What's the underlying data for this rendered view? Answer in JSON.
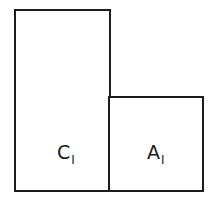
{
  "diagram": {
    "blocks": [
      {
        "id": "c1",
        "label_main": "C",
        "label_sub": "I"
      },
      {
        "id": "a1",
        "label_main": "A",
        "label_sub": "I"
      }
    ],
    "colors": {
      "stroke": "#1c1c1c",
      "fill": "#ffffff",
      "text": "#1a1a1a"
    }
  }
}
